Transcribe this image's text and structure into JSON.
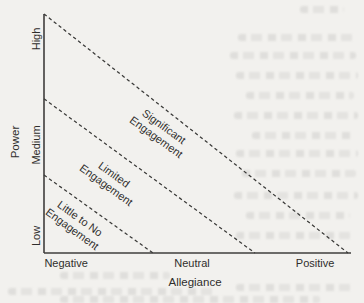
{
  "page": {
    "background_color": "#f2f1ee",
    "ink_color": "#3a3a38",
    "text_color": "#2f2e2c"
  },
  "chart_data": {
    "type": "line",
    "subtype": "conceptual-zone-diagram",
    "title": "",
    "xlabel": "Allegiance",
    "ylabel": "Power",
    "grid": false,
    "legend": false,
    "x_ticks": [
      {
        "label": "Negative",
        "pos": 0.072
      },
      {
        "label": "Neutral",
        "pos": 0.482
      },
      {
        "label": "Positive",
        "pos": 0.883
      }
    ],
    "y_ticks": [
      {
        "label": "Low",
        "pos": 0.071
      },
      {
        "label": "Medium",
        "pos": 0.452
      },
      {
        "label": "High",
        "pos": 0.895
      }
    ],
    "boundary_lines": [
      {
        "style": "dashed",
        "from": [
          0.0,
          1.0
        ],
        "to": [
          0.99,
          0.0
        ]
      },
      {
        "style": "dashed",
        "from": [
          0.0,
          0.645
        ],
        "to": [
          0.687,
          0.0
        ]
      },
      {
        "style": "dashed",
        "from": [
          0.0,
          0.326
        ],
        "to": [
          0.355,
          0.0
        ]
      }
    ],
    "zones": [
      {
        "label": "Significant\nEngagement",
        "center": [
          0.378,
          0.506
        ],
        "rotation_deg": 36
      },
      {
        "label": "Limited\nEngagement",
        "center": [
          0.215,
          0.306
        ],
        "rotation_deg": 36
      },
      {
        "label": "Little to No\nEngagement",
        "center": [
          0.104,
          0.121
        ],
        "rotation_deg": 36
      }
    ],
    "x_title_pos": 0.492
  }
}
